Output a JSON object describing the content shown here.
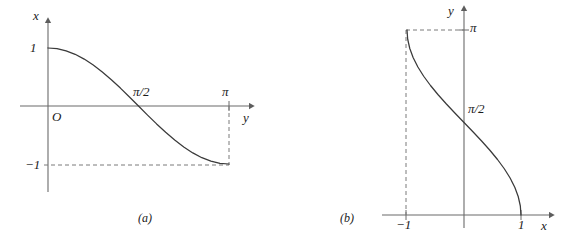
{
  "figure": {
    "stroke_color": "#3a3a3a",
    "axis_color": "#6b6b6b",
    "dash_color": "#7a7a7a",
    "background": "#ffffff"
  },
  "panels": [
    {
      "id": "a",
      "caption": "(a)",
      "vertical_axis_label": "x",
      "horizontal_axis_label": "y",
      "origin_label": "O",
      "ticks": {
        "vertical_top": "1",
        "vertical_bottom": "−1",
        "horizontal_mid": "π/2",
        "horizontal_end": "π"
      }
    },
    {
      "id": "b",
      "caption": "(b)",
      "vertical_axis_label": "y",
      "horizontal_axis_label": "x",
      "ticks": {
        "vertical_top": "π",
        "vertical_mid": "π/2",
        "horizontal_left": "−1",
        "horizontal_right": "1"
      }
    }
  ],
  "chart_data": [
    {
      "type": "line",
      "panel": "a",
      "title": "(a)",
      "function": "x = cos(y)",
      "xlabel": "y",
      "ylabel": "x",
      "xlim": [
        -0.25,
        3.75
      ],
      "ylim": [
        -1.45,
        1.35
      ],
      "grid": false,
      "legend": null,
      "xtick_labels": [
        "π/2",
        "π"
      ],
      "xtick_values": [
        1.5707963,
        3.1415927
      ],
      "ytick_labels": [
        "1",
        "−1"
      ],
      "ytick_values": [
        1,
        -1
      ],
      "origin_label": "O",
      "annotations": [
        {
          "text": "dashed guide from (π,0) down to (π,−1)",
          "x": 3.1415927,
          "y": -1
        },
        {
          "text": "dashed guide from (0,−1) right to (π,−1)",
          "x": 0,
          "y": -1
        }
      ],
      "x": [
        0.0,
        0.15708,
        0.31416,
        0.47124,
        0.62832,
        0.7854,
        0.94248,
        1.09956,
        1.25664,
        1.41372,
        1.5708,
        1.72788,
        1.88496,
        2.04204,
        2.19911,
        2.35619,
        2.51327,
        2.67035,
        2.82743,
        2.98451,
        3.14159
      ],
      "values": [
        1.0,
        0.98769,
        0.95106,
        0.89101,
        0.80902,
        0.70711,
        0.58779,
        0.45399,
        0.30902,
        0.15643,
        0.0,
        -0.15643,
        -0.30902,
        -0.45399,
        -0.58779,
        -0.70711,
        -0.80902,
        -0.89101,
        -0.95106,
        -0.98769,
        -1.0
      ]
    },
    {
      "type": "line",
      "panel": "b",
      "title": "(b)",
      "function": "y = arccos(x)",
      "xlabel": "x",
      "ylabel": "y",
      "xlim": [
        -1.55,
        1.55
      ],
      "ylim": [
        -0.35,
        3.75
      ],
      "grid": false,
      "legend": null,
      "xtick_labels": [
        "−1",
        "1"
      ],
      "xtick_values": [
        -1,
        1
      ],
      "ytick_labels": [
        "π/2",
        "π"
      ],
      "ytick_values": [
        1.5707963,
        3.1415927
      ],
      "annotations": [
        {
          "text": "dashed guide from (−1,π) right to (0,π)",
          "x": -1,
          "y": 3.1415927
        },
        {
          "text": "dashed guide from (−1,0) up to (−1,π)",
          "x": -1,
          "y": 0
        }
      ],
      "x": [
        -1.0,
        -0.98769,
        -0.95106,
        -0.89101,
        -0.80902,
        -0.70711,
        -0.58779,
        -0.45399,
        -0.30902,
        -0.15643,
        0.0,
        0.15643,
        0.30902,
        0.45399,
        0.58779,
        0.70711,
        0.80902,
        0.89101,
        0.95106,
        0.98769,
        1.0
      ],
      "values": [
        3.14159,
        2.98451,
        2.82743,
        2.67035,
        2.51327,
        2.35619,
        2.19911,
        2.04204,
        1.88496,
        1.72788,
        1.5708,
        1.41372,
        1.25664,
        1.09956,
        0.94248,
        0.7854,
        0.62832,
        0.47124,
        0.31416,
        0.15708,
        0.0
      ]
    }
  ]
}
